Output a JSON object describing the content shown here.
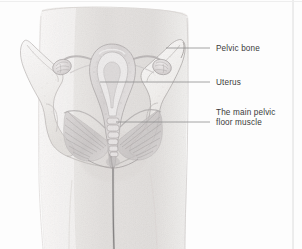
{
  "figure": {
    "background_color": "#fdfdfd",
    "border_color": "#d8d8d8",
    "label_text_color": "#3b3b3b",
    "leader_line_color": "#8e8e8e",
    "skin_tone": "#e6e3e1",
    "bone_tone": "#f1efed",
    "organ_tone": "#dcd9d9",
    "muscle_tone": "#cfcbcb"
  },
  "labels": [
    {
      "id": "pelvic-bone",
      "text": "Pelvic bone",
      "leader": {
        "x1": 210,
        "y1": 48,
        "x2": 166,
        "y2": 48
      }
    },
    {
      "id": "uterus",
      "text": "Uterus",
      "leader": {
        "x1": 210,
        "y1": 82,
        "x2": 100,
        "y2": 82
      }
    },
    {
      "id": "floor-muscle",
      "text": "The main pelvic\nfloor muscle",
      "leader": {
        "x1": 210,
        "y1": 122,
        "x2": 116,
        "y2": 122
      }
    }
  ],
  "anatomy_parts": [
    {
      "name": "torso",
      "description": "hips and upper thighs, front view"
    },
    {
      "name": "left-ilium",
      "description": "left hip bone wing"
    },
    {
      "name": "right-ilium",
      "description": "right hip bone wing"
    },
    {
      "name": "uterus",
      "description": "pear shaped uterus with cavity"
    },
    {
      "name": "left-ovary",
      "description": "left ovary and fallopian tube"
    },
    {
      "name": "right-ovary",
      "description": "right ovary and fallopian tube"
    },
    {
      "name": "vagina",
      "description": "vaginal canal below cervix"
    },
    {
      "name": "sacrum",
      "description": "sacrum and coccyx vertebrae"
    },
    {
      "name": "pelvic-floor-muscle",
      "description": "levator ani fan shaped sling"
    },
    {
      "name": "perineal-line",
      "description": "vertical midline of the cleft"
    }
  ],
  "border": {
    "right_rule_x": 293,
    "top_rule_y": 2
  }
}
